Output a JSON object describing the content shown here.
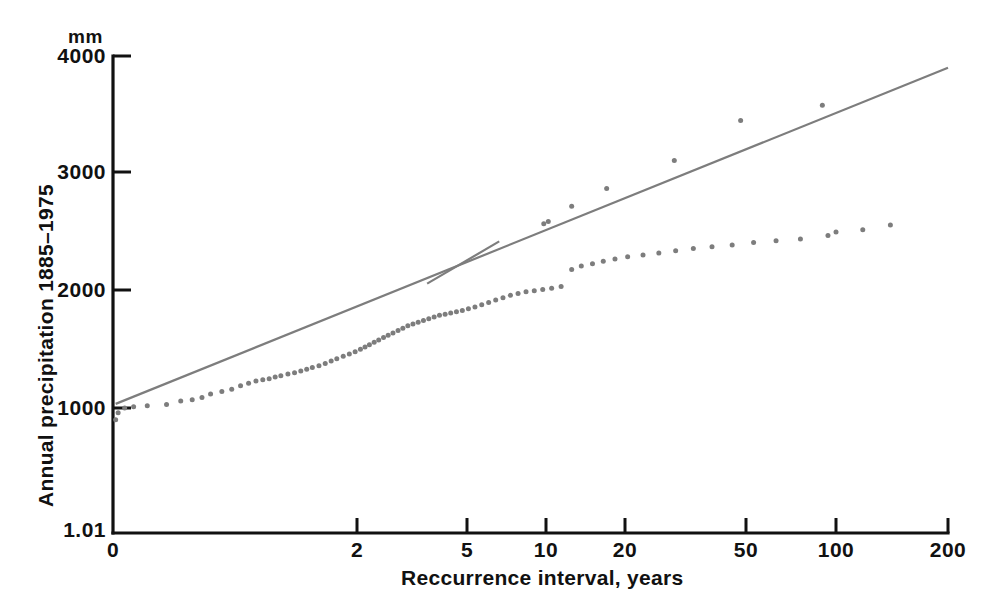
{
  "chart_data": {
    "type": "scatter",
    "title": "",
    "subtitle": "",
    "xlabel": "Reccurrence interval, years",
    "ylabel": "Annual precipitation 1885–1975",
    "y_unit": "mm",
    "x_scale": "gumbel-reduced-variate (probability plot)",
    "y_scale": "linear",
    "xlim": [
      0,
      200
    ],
    "ylim": [
      0,
      4000
    ],
    "grid": false,
    "legend": false,
    "x_tick_labels": [
      "0",
      "2",
      "5",
      "10",
      "20",
      "50",
      "100",
      "200"
    ],
    "x_tick_values": [
      0,
      2,
      5,
      10,
      20,
      50,
      100,
      200
    ],
    "y_tick_labels": [
      "1.01",
      "1000",
      "2000",
      "3000",
      "4000"
    ],
    "y_tick_values": [
      0,
      1000,
      2000,
      3000,
      4000
    ],
    "series": [
      {
        "name": "Annual precipitation observations",
        "marker": "dot",
        "color": "#7d7d7d",
        "points": [
          [
            1.011,
            900
          ],
          [
            1.012,
            960
          ],
          [
            1.015,
            1000
          ],
          [
            1.02,
            1010
          ],
          [
            1.03,
            1020
          ],
          [
            1.05,
            1030
          ],
          [
            1.07,
            1060
          ],
          [
            1.09,
            1070
          ],
          [
            1.11,
            1090
          ],
          [
            1.13,
            1120
          ],
          [
            1.16,
            1140
          ],
          [
            1.19,
            1160
          ],
          [
            1.22,
            1190
          ],
          [
            1.25,
            1210
          ],
          [
            1.28,
            1230
          ],
          [
            1.31,
            1240
          ],
          [
            1.34,
            1250
          ],
          [
            1.37,
            1265
          ],
          [
            1.4,
            1275
          ],
          [
            1.44,
            1290
          ],
          [
            1.48,
            1300
          ],
          [
            1.52,
            1315
          ],
          [
            1.56,
            1330
          ],
          [
            1.6,
            1345
          ],
          [
            1.65,
            1360
          ],
          [
            1.7,
            1380
          ],
          [
            1.75,
            1400
          ],
          [
            1.8,
            1420
          ],
          [
            1.86,
            1440
          ],
          [
            1.92,
            1460
          ],
          [
            1.98,
            1480
          ],
          [
            2.05,
            1500
          ],
          [
            2.12,
            1520
          ],
          [
            2.19,
            1540
          ],
          [
            2.27,
            1560
          ],
          [
            2.35,
            1580
          ],
          [
            2.44,
            1600
          ],
          [
            2.53,
            1620
          ],
          [
            2.63,
            1640
          ],
          [
            2.74,
            1660
          ],
          [
            2.85,
            1680
          ],
          [
            2.97,
            1700
          ],
          [
            3.1,
            1715
          ],
          [
            3.24,
            1730
          ],
          [
            3.39,
            1745
          ],
          [
            3.55,
            1760
          ],
          [
            3.72,
            1775
          ],
          [
            3.9,
            1790
          ],
          [
            4.1,
            1800
          ],
          [
            4.31,
            1810
          ],
          [
            4.54,
            1820
          ],
          [
            4.79,
            1830
          ],
          [
            5.06,
            1845
          ],
          [
            5.35,
            1860
          ],
          [
            5.67,
            1880
          ],
          [
            6.02,
            1900
          ],
          [
            6.4,
            1920
          ],
          [
            6.82,
            1940
          ],
          [
            7.28,
            1960
          ],
          [
            7.79,
            1975
          ],
          [
            8.36,
            1990
          ],
          [
            9.0,
            2000
          ],
          [
            9.71,
            2010
          ],
          [
            10.5,
            2020
          ],
          [
            11.4,
            2035
          ],
          [
            12.5,
            2180
          ],
          [
            13.6,
            2210
          ],
          [
            15.0,
            2230
          ],
          [
            16.5,
            2250
          ],
          [
            18.3,
            2270
          ],
          [
            20.4,
            2290
          ],
          [
            22.9,
            2305
          ],
          [
            25.8,
            2320
          ],
          [
            29.3,
            2340
          ],
          [
            33.5,
            2360
          ],
          [
            38.6,
            2375
          ],
          [
            45.0,
            2390
          ],
          [
            53.0,
            2410
          ],
          [
            63.0,
            2425
          ],
          [
            76.0,
            2440
          ],
          [
            94.0,
            2470
          ],
          [
            100.0,
            2500
          ],
          [
            118.0,
            2520
          ],
          [
            140.0,
            2560
          ],
          [
            9.8,
            2570
          ],
          [
            10.2,
            2590
          ],
          [
            12.5,
            2720
          ],
          [
            17.0,
            2870
          ],
          [
            29.0,
            3110
          ],
          [
            48.0,
            3450
          ],
          [
            90.0,
            3580
          ]
        ]
      }
    ],
    "trend_lines": [
      {
        "name": "main-fit-line",
        "color": "#7d7d7d",
        "style": "solid",
        "from": [
          1.01,
          1035
        ],
        "to": [
          200,
          3900
        ]
      },
      {
        "name": "mid-segment-fit-line",
        "color": "#7d7d7d",
        "style": "solid",
        "from": [
          3.5,
          2060
        ],
        "to": [
          6.6,
          2420
        ]
      }
    ],
    "annotations": [
      {
        "text": "mm",
        "role": "y-axis-unit"
      }
    ]
  },
  "axis": {
    "y_unit_label": "mm",
    "y_title": "Annual precipitation 1885–1975",
    "x_title": "Reccurrence interval, years",
    "y_ticks": [
      {
        "label": "4000",
        "y": 56
      },
      {
        "label": "3000",
        "y": 172
      },
      {
        "label": "2000",
        "y": 290
      },
      {
        "label": "1000",
        "y": 408
      },
      {
        "label": "1.01",
        "y": 533
      }
    ],
    "x_ticks": [
      {
        "label": "0",
        "x": 113
      },
      {
        "label": "2",
        "x": 357
      },
      {
        "label": "5",
        "x": 467
      },
      {
        "label": "10",
        "x": 546
      },
      {
        "label": "20",
        "x": 625
      },
      {
        "label": "50",
        "x": 746
      },
      {
        "label": "100",
        "x": 836
      },
      {
        "label": "200",
        "x": 948
      }
    ]
  },
  "colors": {
    "axis": "#111111",
    "data": "#7d7d7d",
    "background": "#ffffff"
  }
}
